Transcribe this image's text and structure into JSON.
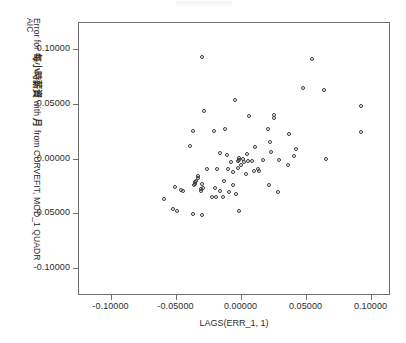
{
  "figure": {
    "faint_header_artifact": "",
    "background_color": "#ffffff",
    "frame_color": "#6e6e6e",
    "marker_color": "#3a3a3a"
  },
  "axis": {
    "x_title": "LAGS(ERR_1, 1)",
    "y_title_line1": "AIC",
    "y_title_line2_prefix": "Error for ",
    "y_title_cjk1": "每小時薪資",
    "y_title_mid": " with ",
    "y_title_cjk2": "月",
    "y_title_suffix": " from CURVEFIT, MOD_1 QUADR",
    "x_ticklabels": [
      "-0.10000",
      "-0.05000",
      "0.00000",
      "0.05000",
      "0.10000"
    ],
    "y_ticklabels": [
      "0.10000",
      "0.05000",
      "0.00000",
      "-0.05000",
      "-0.10000"
    ]
  },
  "chart_data": {
    "type": "scatter",
    "title": "",
    "xlabel": "LAGS(ERR_1, 1)",
    "ylabel": "AIC Error for 每小時薪資 with 月 from CURVEFIT, MOD_1 QUADR",
    "xlim": [
      -0.125,
      0.115
    ],
    "ylim": [
      -0.125,
      0.125
    ],
    "xticks": [
      -0.1,
      -0.05,
      0.0,
      0.05,
      0.1
    ],
    "yticks": [
      0.1,
      0.05,
      0.0,
      -0.05,
      -0.1
    ],
    "grid": false,
    "legend": null,
    "marker": "open-circle",
    "n_points": 77,
    "points": [
      [
        -0.03,
        0.093
      ],
      [
        0.0545,
        0.0915
      ],
      [
        0.048,
        0.065
      ],
      [
        0.064,
        0.0628
      ],
      [
        -0.0045,
        0.0537
      ],
      [
        0.092,
        0.0482
      ],
      [
        -0.0285,
        0.0437
      ],
      [
        0.006,
        0.0395
      ],
      [
        0.0255,
        0.04
      ],
      [
        0.0255,
        0.0375
      ],
      [
        -0.037,
        0.0253
      ],
      [
        -0.0205,
        0.0258
      ],
      [
        -0.012,
        0.0278
      ],
      [
        0.0205,
        0.0275
      ],
      [
        0.037,
        0.0228
      ],
      [
        0.0925,
        0.025
      ],
      [
        0.0225,
        0.016
      ],
      [
        -0.0395,
        0.012
      ],
      [
        0.0105,
        0.011
      ],
      [
        0.042,
        0.0095
      ],
      [
        0.023,
        0.006
      ],
      [
        -0.0165,
        0.0052
      ],
      [
        -0.0105,
        0.004
      ],
      [
        0.0045,
        0.0043
      ],
      [
        0.041,
        0.0025
      ],
      [
        0.065,
        0.0003
      ],
      [
        0.0055,
        -0.002
      ],
      [
        0.0085,
        -0.0022
      ],
      [
        -0.0022,
        -0.0017
      ],
      [
        -0.0017,
        -0.0013
      ],
      [
        0.036,
        -0.0053
      ],
      [
        -0.0025,
        -0.0085
      ],
      [
        -0.01,
        -0.0088
      ],
      [
        -0.0265,
        -0.009
      ],
      [
        0.0135,
        -0.011
      ],
      [
        0.01,
        -0.0108
      ],
      [
        -0.006,
        -0.0122
      ],
      [
        -0.033,
        -0.0155
      ],
      [
        -0.0333,
        -0.0178
      ],
      [
        -0.013,
        -0.0198
      ],
      [
        -0.0352,
        -0.0225
      ],
      [
        -0.0365,
        -0.0235
      ],
      [
        -0.03,
        -0.0232
      ],
      [
        0.0215,
        -0.0235
      ],
      [
        -0.006,
        -0.024
      ],
      [
        -0.0505,
        -0.0258
      ],
      [
        -0.046,
        -0.0282
      ],
      [
        -0.031,
        -0.0278
      ],
      [
        -0.0305,
        -0.0292
      ],
      [
        -0.0165,
        -0.0295
      ],
      [
        0.0285,
        -0.0298
      ],
      [
        -0.004,
        -0.0318
      ],
      [
        -0.0595,
        -0.0365
      ],
      [
        -0.0225,
        -0.0345
      ],
      [
        -0.0193,
        -0.0348
      ],
      [
        -0.014,
        -0.0352
      ],
      [
        -0.0525,
        -0.0455
      ],
      [
        -0.049,
        -0.0475
      ],
      [
        -0.0012,
        -0.0478
      ],
      [
        -0.0368,
        -0.0505
      ],
      [
        -0.03,
        -0.0517
      ],
      [
        0.0018,
        0.0
      ],
      [
        0.002,
        -0.003
      ],
      [
        -0.008,
        -0.003
      ],
      [
        0.0,
        -0.0055
      ],
      [
        -0.0185,
        -0.0095
      ],
      [
        0.0128,
        -0.0095
      ],
      [
        0.0038,
        -0.014
      ],
      [
        -0.0345,
        -0.0205
      ],
      [
        -0.0355,
        -0.0212
      ],
      [
        -0.02,
        -0.0262
      ],
      [
        -0.0295,
        -0.0262
      ],
      [
        -0.0095,
        -0.03
      ],
      [
        0.0172,
        -0.0012
      ],
      [
        0.0292,
        -0.0008
      ],
      [
        -0.0445,
        -0.0295
      ],
      [
        -0.0012,
        0.0012
      ]
    ]
  }
}
